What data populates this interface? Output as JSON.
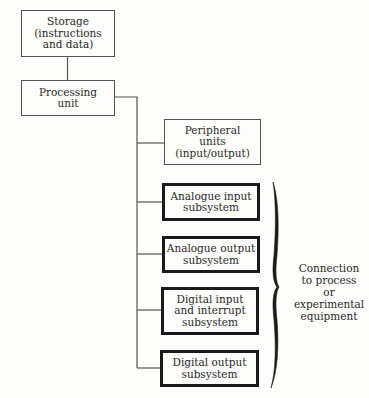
{
  "diagram": {
    "nodes": {
      "storage": {
        "lines": [
          "Storage",
          "(instructions",
          "and data)"
        ],
        "style": "thin"
      },
      "processing": {
        "lines": [
          "Processing",
          "unit"
        ],
        "style": "thin"
      },
      "peripheral": {
        "lines": [
          "Peripheral",
          "units",
          "(input/output)"
        ],
        "style": "thin"
      },
      "analogue_input": {
        "lines": [
          "Analogue input",
          "subsystem"
        ],
        "style": "thick"
      },
      "analogue_output": {
        "lines": [
          "Analogue output",
          "subsystem"
        ],
        "style": "thick"
      },
      "digital_input": {
        "lines": [
          "Digital input",
          "and interrupt",
          "subsystem"
        ],
        "style": "thick"
      },
      "digital_output": {
        "lines": [
          "Digital output",
          "subsystem"
        ],
        "style": "thick"
      }
    },
    "edges": [
      {
        "from": "storage",
        "to": "processing"
      },
      {
        "from": "processing",
        "to": "peripheral"
      },
      {
        "from": "processing",
        "to": "analogue_input"
      },
      {
        "from": "processing",
        "to": "analogue_output"
      },
      {
        "from": "processing",
        "to": "digital_input"
      },
      {
        "from": "processing",
        "to": "digital_output"
      }
    ],
    "brace_annotation": {
      "groups": [
        "analogue_input",
        "analogue_output",
        "digital_input",
        "digital_output"
      ],
      "lines": [
        "Connection",
        "to process",
        "or",
        "experimental",
        "equipment"
      ]
    },
    "colors": {
      "background": "#fdfdfb",
      "thin_border": "#555555",
      "thick_border": "#1a1a1a",
      "text": "#2a2a2a"
    }
  }
}
